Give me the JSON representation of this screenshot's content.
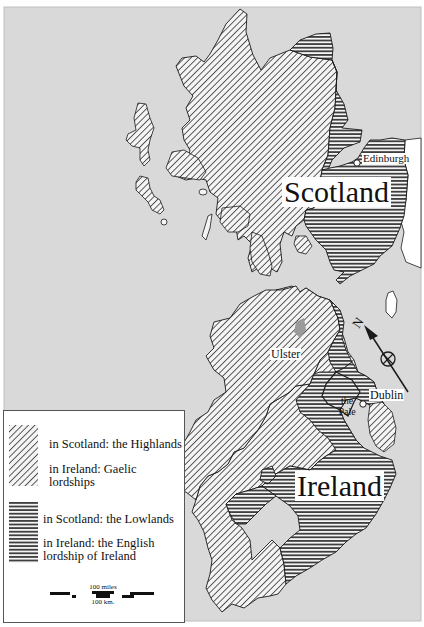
{
  "map": {
    "title_labels": {
      "scotland": "Scotland",
      "ireland": "Ireland"
    },
    "places": {
      "edinburgh": "Edinburgh",
      "dublin": "Dublin",
      "ulster": "Ulster",
      "pale_line1": "the",
      "pale_line2": "Pale"
    },
    "compass": {
      "label": "N",
      "icon": "north-arrow-icon"
    },
    "colors": {
      "sea": "#d9d9d9",
      "land_other": "#ffffff",
      "ink": "#1a1a1a",
      "ulster_mark": "#9a9a9a"
    }
  },
  "legend": {
    "items": [
      {
        "pattern": "diagonal-hatch",
        "lines": [
          "in Scotland: the Highlands",
          "in Ireland: Gaelic lordships"
        ]
      },
      {
        "pattern": "horizontal-hatch",
        "lines": [
          "in Scotland: the Lowlands",
          "in Ireland: the English",
          "lordship of Ireland"
        ]
      }
    ],
    "scale": {
      "miles": "100 miles",
      "km": "100 km."
    }
  }
}
